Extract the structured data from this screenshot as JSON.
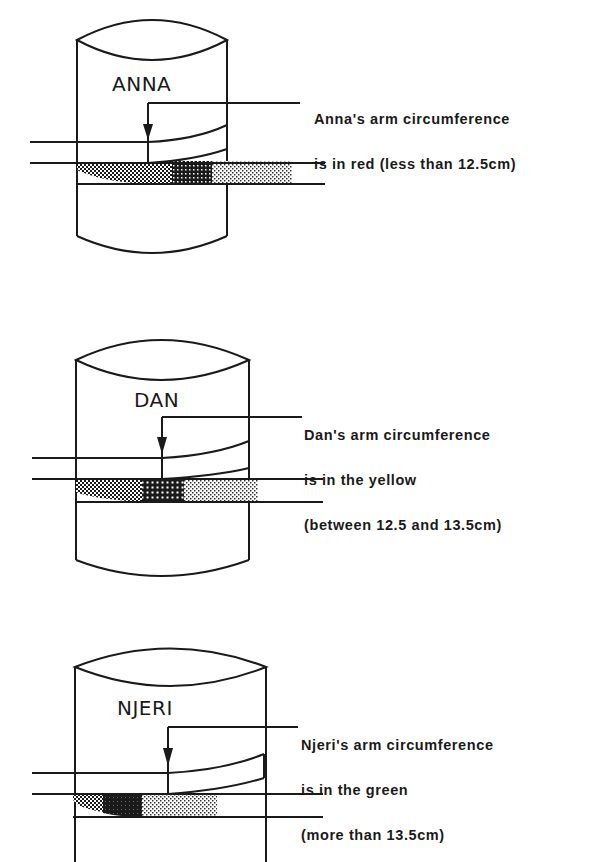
{
  "figures": [
    {
      "name": "ANNA",
      "caption_lines": [
        "Anna's arm circumference",
        "is in red (less than 12.5cm)"
      ],
      "band_zone_indicated": "red",
      "threshold": "less than 12.5cm"
    },
    {
      "name": "DAN",
      "caption_lines": [
        "Dan's arm circumference",
        "is in the yellow",
        "(between 12.5 and 13.5cm)"
      ],
      "band_zone_indicated": "yellow",
      "threshold": "between 12.5 and 13.5cm"
    },
    {
      "name": "NJERI",
      "caption_lines": [
        "Njeri's arm circumference",
        "is in the green",
        "(more than 13.5cm)"
      ],
      "band_zone_indicated": "green",
      "threshold": "more than 13.5cm"
    }
  ],
  "colors": {
    "line": "#1a1a1a",
    "background": "#ffffff"
  }
}
